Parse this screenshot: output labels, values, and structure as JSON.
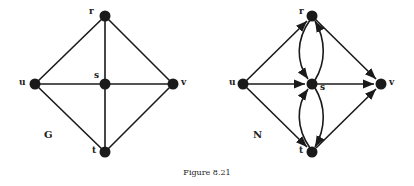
{
  "caption": "Figure 8.21",
  "graphs": [
    {
      "name": "G",
      "type": "undirected",
      "nodes": {
        "r": {
          "label": "r",
          "x": 105,
          "y": 16
        },
        "u": {
          "label": "u",
          "x": 35,
          "y": 84
        },
        "s": {
          "label": "s",
          "x": 105,
          "y": 84
        },
        "v": {
          "label": "v",
          "x": 173,
          "y": 84
        },
        "t": {
          "label": "t",
          "x": 105,
          "y": 152
        }
      },
      "edges": [
        [
          "u",
          "r"
        ],
        [
          "r",
          "v"
        ],
        [
          "u",
          "t"
        ],
        [
          "t",
          "v"
        ],
        [
          "u",
          "v"
        ],
        [
          "r",
          "t"
        ]
      ]
    },
    {
      "name": "N",
      "type": "directed",
      "nodes": {
        "r": {
          "label": "r",
          "x": 312,
          "y": 16
        },
        "u": {
          "label": "u",
          "x": 243,
          "y": 84
        },
        "s": {
          "label": "s",
          "x": 312,
          "y": 84
        },
        "v": {
          "label": "v",
          "x": 381,
          "y": 84
        },
        "t": {
          "label": "t",
          "x": 312,
          "y": 152
        }
      },
      "arcs": [
        [
          "u",
          "r"
        ],
        [
          "u",
          "s"
        ],
        [
          "u",
          "t"
        ],
        [
          "r",
          "v"
        ],
        [
          "s",
          "v"
        ],
        [
          "t",
          "v"
        ],
        [
          "r",
          "s"
        ],
        [
          "s",
          "r"
        ],
        [
          "t",
          "s"
        ],
        [
          "s",
          "t"
        ]
      ]
    }
  ],
  "colors": {
    "ink": "#1a1a1a",
    "background": "#ffffff"
  }
}
